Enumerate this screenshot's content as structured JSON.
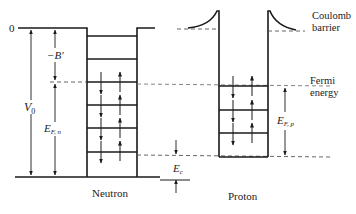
{
  "diagram": {
    "zero_label": "0",
    "labels": {
      "binding": "−B′",
      "v0": "V",
      "v0_sub": "0",
      "efn": "E",
      "efn_sub": "F, n",
      "efp": "E",
      "efp_sub": "F, p",
      "ec": "E",
      "ec_sub": "c",
      "coulomb_line1": "Coulomb",
      "coulomb_line2": "barrier",
      "fermi_line1": "Fermi",
      "fermi_line2": "energy",
      "neutron": "Neutron",
      "proton": "Proton"
    },
    "neutron_well": {
      "levels_filled": 4,
      "levels_empty": 2,
      "spin_arrows": [
        "down",
        "up"
      ]
    },
    "proton_well": {
      "levels_filled": 3,
      "spin_arrows": [
        "down",
        "up"
      ]
    },
    "colors": {
      "line": "#1a1a1a",
      "dash": "#555555",
      "text": "#222222"
    }
  }
}
